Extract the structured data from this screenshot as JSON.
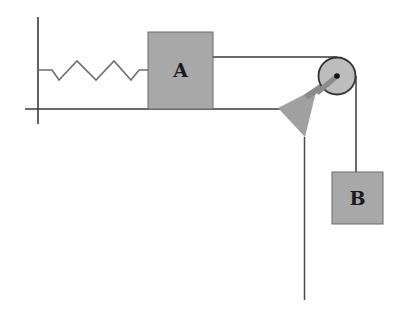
{
  "diagram": {
    "type": "physics-pulley-system",
    "blocks": [
      {
        "id": "A",
        "label": "A",
        "position": "on horizontal surface, attached to spring on left"
      },
      {
        "id": "B",
        "label": "B",
        "position": "hanging vertically from pulley"
      }
    ],
    "components": [
      "wall",
      "spring",
      "horizontal-surface",
      "pulley",
      "pulley-bracket",
      "string",
      "table-leg"
    ],
    "colors": {
      "block_fill": "#a8a8a8",
      "block_stroke": "#6a6a6a",
      "line": "#3a3a3a",
      "spring": "#6e6e6e",
      "pulley_fill": "#bdbdbd",
      "bracket_fill": "#a0a0a0"
    }
  }
}
